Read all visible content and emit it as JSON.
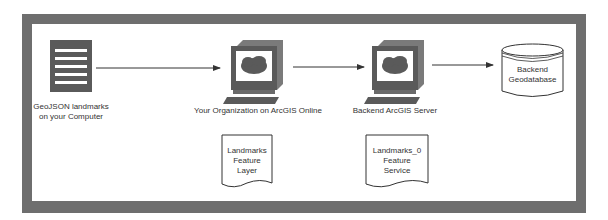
{
  "diagram": {
    "colors": {
      "frame": "#6e6e6e",
      "icon_dark": "#5a5a5a",
      "line": "#333333",
      "background": "#ffffff"
    },
    "nodes": [
      {
        "id": "geojson",
        "icon": "document-lines-icon",
        "label_lines": [
          "GeoJSON landmarks",
          "on your Computer"
        ]
      },
      {
        "id": "arcgis-online",
        "icon": "computer-cloud-icon",
        "label_lines": [
          "Your Organization on ArcGIS Online"
        ]
      },
      {
        "id": "arcgis-server",
        "icon": "computer-cloud-icon",
        "label_lines": [
          "Backend ArcGIS Server"
        ]
      },
      {
        "id": "geodatabase",
        "icon": "database-cylinder-icon",
        "label_lines": [
          "Backend",
          "Geodatabase"
        ]
      }
    ],
    "documents": [
      {
        "id": "feature-layer",
        "icon": "wavy-document-icon",
        "label_lines": [
          "Landmarks",
          "Feature",
          "Layer"
        ]
      },
      {
        "id": "feature-service",
        "icon": "wavy-document-icon",
        "label_lines": [
          "Landmarks_0",
          "Feature",
          "Service"
        ]
      }
    ],
    "edges": [
      {
        "from": "geojson",
        "to": "arcgis-online"
      },
      {
        "from": "arcgis-online",
        "to": "arcgis-server"
      },
      {
        "from": "arcgis-server",
        "to": "geodatabase"
      }
    ]
  }
}
